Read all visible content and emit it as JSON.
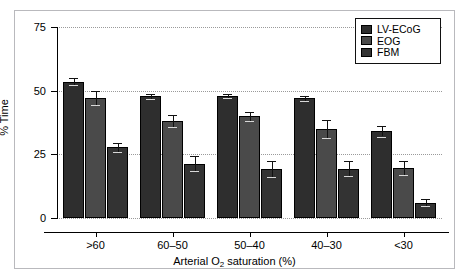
{
  "chart_data": {
    "type": "bar",
    "title": "",
    "subtitle": "",
    "xlabel": "Arterial O2 saturation (%)",
    "xlabel_parts": {
      "pre": "Arterial O",
      "sub": "2",
      "post": " saturation (%)"
    },
    "ylabel": "% Time",
    "categories": [
      ">60",
      "60–50",
      "50–40",
      "40–30",
      "<30"
    ],
    "ylim": [
      0,
      75
    ],
    "yticks": [
      0,
      25,
      50,
      75
    ],
    "ytick_labels": [
      "0",
      "25",
      "50",
      "75"
    ],
    "grid": "horizontal-dotted",
    "legend_position": "top-right",
    "series": [
      {
        "name": "LV-ECoG",
        "color": "#2e2e2e",
        "values": [
          53.5,
          47.8,
          47.9,
          47.0,
          34.0
        ],
        "errors": [
          1.3,
          0.9,
          0.9,
          1.0,
          2.0
        ]
      },
      {
        "name": "EOG",
        "color": "#4a4a4a",
        "values": [
          47.2,
          38.2,
          40.0,
          35.0,
          19.5
        ],
        "errors": [
          2.7,
          2.4,
          1.8,
          3.4,
          2.8
        ]
      },
      {
        "name": "FBM",
        "color": "#333333",
        "values": [
          27.8,
          21.3,
          19.2,
          19.3,
          6.0
        ],
        "errors": [
          1.7,
          3.0,
          3.0,
          3.0,
          1.4
        ]
      }
    ]
  },
  "legend": {
    "items": [
      {
        "label": "LV-ECoG",
        "color": "#2e2e2e"
      },
      {
        "label": "EOG",
        "color": "#4a4a4a"
      },
      {
        "label": "FBM",
        "color": "#333333"
      }
    ]
  },
  "axes": {
    "y_tick_labels": [
      "75",
      "50",
      "25",
      "0"
    ],
    "y_title": "% Time",
    "x_tick_labels": [
      ">60",
      "60–50",
      "50–40",
      "40–30",
      "<30"
    ]
  },
  "colors": {
    "frame": "#b9b9bd",
    "axis": "#000000",
    "grid": "#9a9a9a",
    "background": "#ffffff"
  }
}
